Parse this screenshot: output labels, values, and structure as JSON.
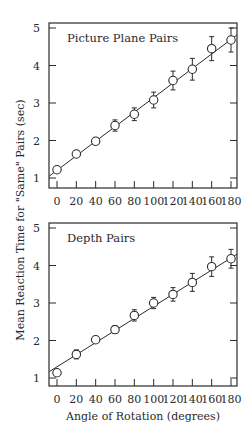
{
  "chart_data": [
    {
      "type": "scatter",
      "title": "Picture Plane Pairs",
      "xlabel": "Angle of Rotation (degrees)",
      "ylabel": "Mean Reaction Time for \"Same\" Pairs (sec)",
      "x": [
        0,
        20,
        40,
        60,
        80,
        100,
        120,
        140,
        160,
        180
      ],
      "series": [
        {
          "name": "Picture Plane Pairs",
          "values": [
            1.22,
            1.64,
            1.98,
            2.4,
            2.7,
            3.08,
            3.6,
            3.9,
            4.45,
            4.68
          ],
          "error": [
            0.05,
            0.09,
            0.09,
            0.15,
            0.17,
            0.21,
            0.25,
            0.29,
            0.32,
            0.32
          ]
        }
      ],
      "fit_line": {
        "x0": -8,
        "y0": 1.05,
        "x1": 188,
        "y1": 4.85
      },
      "xticks": [
        0,
        20,
        40,
        60,
        80,
        100,
        120,
        140,
        160,
        180
      ],
      "yticks": [
        1,
        2,
        3,
        4,
        5
      ],
      "xlim": [
        -8,
        188
      ],
      "ylim": [
        0.9,
        5.2
      ],
      "grid": false
    },
    {
      "type": "scatter",
      "title": "Depth Pairs",
      "xlabel": "Angle of Rotation (degrees)",
      "ylabel": "Mean Reaction Time for \"Same\" Pairs (sec)",
      "x": [
        0,
        20,
        40,
        60,
        80,
        100,
        120,
        140,
        160,
        180
      ],
      "series": [
        {
          "name": "Depth Pairs",
          "values": [
            1.14,
            1.63,
            2.02,
            2.29,
            2.67,
            3.0,
            3.23,
            3.55,
            3.97,
            4.18
          ],
          "error": [
            0.0,
            0.12,
            0.0,
            0.1,
            0.15,
            0.15,
            0.18,
            0.24,
            0.26,
            0.25
          ]
        }
      ],
      "fit_line": {
        "x0": -8,
        "y0": 1.17,
        "x1": 188,
        "y1": 4.33
      },
      "xticks": [
        0,
        20,
        40,
        60,
        80,
        100,
        120,
        140,
        160,
        180
      ],
      "yticks": [
        1,
        2,
        3,
        4,
        5
      ],
      "xlim": [
        -8,
        188
      ],
      "ylim": [
        0.9,
        5.2
      ],
      "grid": false
    }
  ],
  "labels": {
    "top_title": "Picture Plane Pairs",
    "bottom_title": "Depth Pairs",
    "ylabel": "Mean Reaction Time for \"Same\" Pairs (sec)",
    "xlabel": "Angle of Rotation (degrees)",
    "xtick_labels": [
      "0",
      "20",
      "40",
      "60",
      "80",
      "100",
      "120",
      "140",
      "160",
      "180"
    ],
    "ytick_labels": [
      "1",
      "2",
      "3",
      "4",
      "5"
    ]
  },
  "colors": {
    "ink": "#2a2a2a",
    "background": "#ffffff"
  }
}
